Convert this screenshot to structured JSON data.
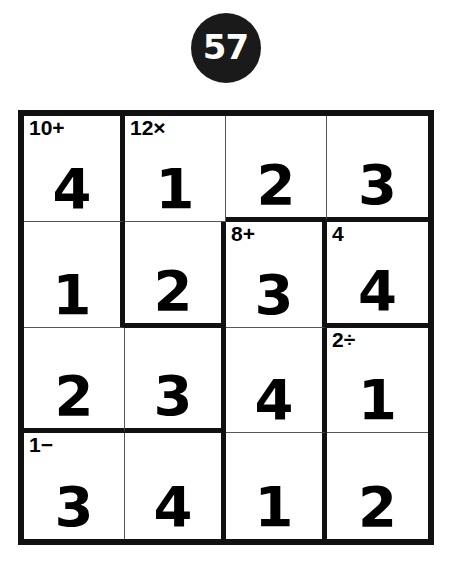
{
  "puzzle": {
    "number": "57",
    "size": 4,
    "badge_color": "#1a1a1a",
    "ink_color": "#000000",
    "grid_line_color": "#555555",
    "cage_line_color": "#111111"
  },
  "grid": {
    "rows": [
      [
        {
          "value": "4",
          "cage": "10+",
          "thick_right": true,
          "thick_bottom": false
        },
        {
          "value": "1",
          "cage": "12×",
          "thick_right": false,
          "thick_bottom": false
        },
        {
          "value": "2",
          "cage": "",
          "thick_right": false,
          "thick_bottom": true
        },
        {
          "value": "3",
          "cage": "",
          "thick_right": false,
          "thick_bottom": true
        }
      ],
      [
        {
          "value": "1",
          "cage": "",
          "thick_right": true,
          "thick_bottom": false
        },
        {
          "value": "2",
          "cage": "",
          "thick_right": true,
          "thick_bottom": true
        },
        {
          "value": "3",
          "cage": "8+",
          "thick_right": true,
          "thick_bottom": false
        },
        {
          "value": "4",
          "cage": "4",
          "thick_right": false,
          "thick_bottom": true
        }
      ],
      [
        {
          "value": "2",
          "cage": "",
          "thick_right": false,
          "thick_bottom": true
        },
        {
          "value": "3",
          "cage": "",
          "thick_right": true,
          "thick_bottom": true
        },
        {
          "value": "4",
          "cage": "",
          "thick_right": true,
          "thick_bottom": false
        },
        {
          "value": "1",
          "cage": "2÷",
          "thick_right": false,
          "thick_bottom": false
        }
      ],
      [
        {
          "value": "3",
          "cage": "1−",
          "thick_right": false,
          "thick_bottom": false
        },
        {
          "value": "4",
          "cage": "",
          "thick_right": true,
          "thick_bottom": false
        },
        {
          "value": "1",
          "cage": "",
          "thick_right": true,
          "thick_bottom": false
        },
        {
          "value": "2",
          "cage": "",
          "thick_right": false,
          "thick_bottom": false
        }
      ]
    ]
  }
}
